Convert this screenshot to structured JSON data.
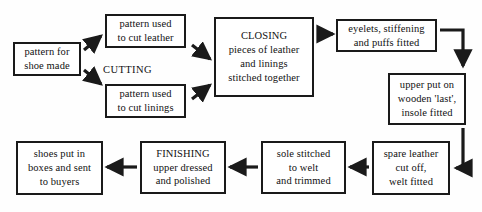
{
  "diagram": {
    "width": 482,
    "height": 212,
    "line_color": "#1a1a1a",
    "text_color": "#111111",
    "background": "#fefefe",
    "captions": [
      {
        "text": "CUTTING",
        "x": 103,
        "y": 64
      }
    ],
    "nodes": [
      {
        "id": "pattern-for-shoe-made",
        "lines": [
          "pattern for",
          "shoe made"
        ],
        "x": 13,
        "y": 42,
        "w": 68,
        "h": 34
      },
      {
        "id": "pattern-used-to-cut-leather",
        "lines": [
          "pattern used",
          "to cut leather"
        ],
        "x": 105,
        "y": 14,
        "w": 81,
        "h": 34
      },
      {
        "id": "pattern-used-to-cut-linings",
        "lines": [
          "pattern used",
          "to cut linings"
        ],
        "x": 105,
        "y": 84,
        "w": 81,
        "h": 34
      },
      {
        "id": "closing",
        "lines": [
          "CLOSING",
          "pieces of leather",
          "and linings",
          "stitched together"
        ],
        "x": 214,
        "y": 17,
        "w": 100,
        "h": 80
      },
      {
        "id": "eyelets-stiffening-puffs",
        "lines": [
          "eyelets, stiffening",
          "and puffs fitted"
        ],
        "x": 336,
        "y": 19,
        "w": 101,
        "h": 33
      },
      {
        "id": "upper-put-on-last",
        "lines": [
          "upper put on",
          "wooden 'last',",
          "insole fitted"
        ],
        "x": 388,
        "y": 73,
        "w": 78,
        "h": 52
      },
      {
        "id": "spare-leather-cut-off",
        "lines": [
          "spare leather",
          "cut off,",
          "welt fitted"
        ],
        "x": 372,
        "y": 141,
        "w": 78,
        "h": 54
      },
      {
        "id": "sole-stitched-to-welt",
        "lines": [
          "sole stitched",
          "to welt",
          "and trimmed"
        ],
        "x": 261,
        "y": 141,
        "w": 85,
        "h": 53
      },
      {
        "id": "finishing",
        "lines": [
          "FINISHING",
          "upper dressed",
          "and polished"
        ],
        "x": 140,
        "y": 141,
        "w": 86,
        "h": 53
      },
      {
        "id": "shoes-put-in-boxes",
        "lines": [
          "shoes put in",
          "boxes and sent",
          "to buyers"
        ],
        "x": 16,
        "y": 141,
        "w": 87,
        "h": 54
      }
    ]
  }
}
